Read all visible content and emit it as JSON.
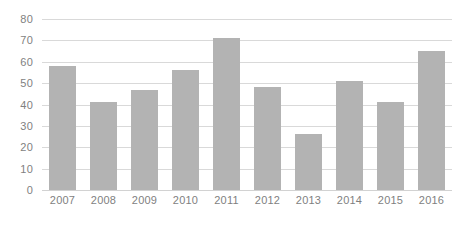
{
  "chart_data": {
    "type": "bar",
    "title": "",
    "subtitle": "",
    "xlabel": "",
    "ylabel": "",
    "categories": [
      "2007",
      "2008",
      "2009",
      "2010",
      "2011",
      "2012",
      "2013",
      "2014",
      "2015",
      "2016"
    ],
    "values": [
      58,
      41,
      47,
      56,
      71,
      48,
      26,
      51,
      41,
      65
    ],
    "series": [
      {
        "name": "",
        "values": [
          58,
          41,
          47,
          56,
          71,
          48,
          26,
          51,
          41,
          65
        ]
      }
    ],
    "ylim": [
      0,
      80
    ],
    "ytick_labels": [
      "0",
      "10",
      "20",
      "30",
      "40",
      "50",
      "60",
      "70",
      "80"
    ],
    "ytick_values": [
      0,
      10,
      20,
      30,
      40,
      50,
      60,
      70,
      80
    ],
    "grid": true,
    "grid_axis": "y",
    "legend": false,
    "legend_position": "none",
    "annotations": [],
    "colors": {
      "bar": "#b3b3b3",
      "gridline": "#d9d9d9",
      "baseline": "#d2d2d2",
      "tick_label": "#7f7f7f",
      "background": "#ffffff"
    }
  }
}
